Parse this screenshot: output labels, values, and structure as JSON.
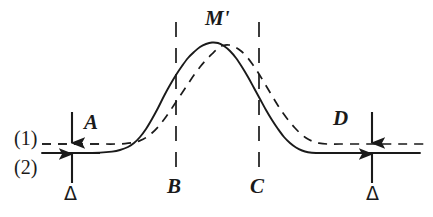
{
  "figure": {
    "type": "line-diagram",
    "background_color": "#ffffff",
    "ink_color": "#1a1a1a"
  },
  "labels": {
    "curve1": "(1)",
    "curve2": "(2)",
    "point_A": "A",
    "point_B": "B",
    "point_C": "C",
    "point_D": "D",
    "peak": "M'",
    "delta_left": "Δ",
    "delta_right": "Δ"
  },
  "chart_data": {
    "type": "line",
    "title": "",
    "xlabel": "",
    "ylabel": "",
    "xlim": [
      0,
      433
    ],
    "ylim": [
      0,
      217
    ],
    "grid": false,
    "legend": null,
    "annotations": [
      {
        "name": "curve-1-label",
        "text": "(1)",
        "x": 24,
        "y": 138,
        "role": "series-label"
      },
      {
        "name": "curve-2-label",
        "text": "(2)",
        "x": 24,
        "y": 167,
        "role": "series-label"
      },
      {
        "name": "marker-A",
        "text": "A",
        "x": 90,
        "y": 122,
        "role": "baseline-offset-left"
      },
      {
        "name": "marker-D",
        "text": "D",
        "x": 339,
        "y": 118,
        "role": "baseline-offset-right"
      },
      {
        "name": "marker-M-prime",
        "text": "M'",
        "x": 214,
        "y": 18,
        "role": "peak-maximum"
      },
      {
        "name": "marker-B",
        "text": "B",
        "x": 173,
        "y": 186,
        "role": "vertical-cut-left"
      },
      {
        "name": "marker-C",
        "text": "C",
        "x": 256,
        "y": 186,
        "role": "vertical-cut-right"
      },
      {
        "name": "delta-left",
        "text": "Δ",
        "x": 70,
        "y": 194,
        "role": "baseline-gap"
      },
      {
        "name": "delta-right",
        "text": "Δ",
        "x": 372,
        "y": 194,
        "role": "baseline-gap"
      }
    ],
    "baselines": [
      {
        "name": "baseline-1-dashed",
        "series": "(1)",
        "y": 144,
        "style": "dashed"
      },
      {
        "name": "baseline-2-solid",
        "series": "(2)",
        "y": 153,
        "style": "solid"
      }
    ],
    "vertical_cuts": [
      {
        "name": "cut-B",
        "label": "B",
        "x": 176,
        "y_top": 22,
        "y_bottom": 172,
        "style": "long-dashed"
      },
      {
        "name": "cut-C",
        "label": "C",
        "x": 259,
        "y_top": 22,
        "y_bottom": 172,
        "style": "long-dashed"
      }
    ],
    "gap_arrows": [
      {
        "name": "gap-arrow-left",
        "x": 72,
        "label": "Δ"
      },
      {
        "name": "gap-arrow-right",
        "x": 372,
        "label": "Δ"
      }
    ],
    "series": [
      {
        "name": "(2)",
        "style": "solid",
        "baseline_y": 153,
        "peak": {
          "x": 212,
          "y": 42
        },
        "points": [
          [
            42,
            153
          ],
          [
            60,
            153
          ],
          [
            80,
            153
          ],
          [
            100,
            152.6
          ],
          [
            112,
            151.6
          ],
          [
            120,
            150
          ],
          [
            128,
            147
          ],
          [
            134,
            143
          ],
          [
            140,
            137
          ],
          [
            146,
            129
          ],
          [
            152,
            119
          ],
          [
            158,
            108
          ],
          [
            164,
            96
          ],
          [
            170,
            85
          ],
          [
            176,
            75
          ],
          [
            182,
            66
          ],
          [
            188,
            58
          ],
          [
            194,
            52
          ],
          [
            200,
            47
          ],
          [
            206,
            44
          ],
          [
            212,
            42.5
          ],
          [
            218,
            43
          ],
          [
            224,
            46
          ],
          [
            230,
            51
          ],
          [
            236,
            58
          ],
          [
            242,
            67
          ],
          [
            248,
            77
          ],
          [
            254,
            88
          ],
          [
            260,
            99
          ],
          [
            266,
            110
          ],
          [
            272,
            120
          ],
          [
            278,
            129
          ],
          [
            284,
            137
          ],
          [
            290,
            143
          ],
          [
            296,
            147.5
          ],
          [
            302,
            150.5
          ],
          [
            308,
            152.2
          ],
          [
            316,
            153
          ],
          [
            330,
            153
          ],
          [
            360,
            153
          ],
          [
            395,
            153
          ],
          [
            420,
            153
          ]
        ]
      },
      {
        "name": "(1)",
        "style": "dashed",
        "baseline_y": 144,
        "peak": {
          "x": 223,
          "y": 45
        },
        "points": [
          [
            42,
            144
          ],
          [
            60,
            144
          ],
          [
            80,
            144
          ],
          [
            100,
            144
          ],
          [
            115,
            144
          ],
          [
            125,
            143.6
          ],
          [
            133,
            142.6
          ],
          [
            140,
            140.6
          ],
          [
            146,
            137.6
          ],
          [
            152,
            133
          ],
          [
            158,
            127
          ],
          [
            164,
            119.5
          ],
          [
            170,
            111
          ],
          [
            176,
            102
          ],
          [
            182,
            93
          ],
          [
            188,
            84
          ],
          [
            194,
            75
          ],
          [
            200,
            67
          ],
          [
            206,
            60
          ],
          [
            212,
            54
          ],
          [
            218,
            48.5
          ],
          [
            223,
            45.5
          ],
          [
            229,
            45
          ],
          [
            235,
            47
          ],
          [
            241,
            51
          ],
          [
            247,
            57
          ],
          [
            253,
            65
          ],
          [
            259,
            74
          ],
          [
            265,
            84
          ],
          [
            271,
            94
          ],
          [
            277,
            104
          ],
          [
            283,
            113
          ],
          [
            289,
            121
          ],
          [
            295,
            128
          ],
          [
            301,
            134
          ],
          [
            307,
            138.5
          ],
          [
            313,
            141.5
          ],
          [
            319,
            143.2
          ],
          [
            327,
            144
          ],
          [
            340,
            144
          ],
          [
            370,
            144
          ],
          [
            400,
            144
          ],
          [
            424,
            144
          ]
        ]
      }
    ]
  }
}
